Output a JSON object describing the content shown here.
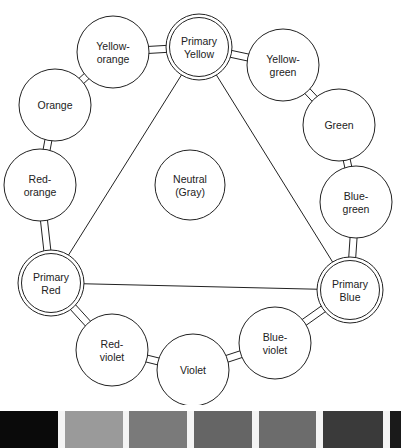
{
  "diagram": {
    "type": "color-wheel",
    "center": {
      "label_line1": "Neutral",
      "label_line2": "(Gray)",
      "cx": 190,
      "cy": 185,
      "r": 35
    },
    "nodes": [
      {
        "id": "primary-yellow",
        "line1": "Primary",
        "line2": "Yellow",
        "cx": 199,
        "cy": 47,
        "r": 33,
        "primary": true
      },
      {
        "id": "yellow-green",
        "line1": "Yellow-",
        "line2": "green",
        "cx": 283,
        "cy": 65,
        "r": 36,
        "primary": false
      },
      {
        "id": "green",
        "line1": "Green",
        "line2": "",
        "cx": 339,
        "cy": 125,
        "r": 36,
        "primary": false
      },
      {
        "id": "blue-green",
        "line1": "Blue-",
        "line2": "green",
        "cx": 356,
        "cy": 202,
        "r": 36,
        "primary": false
      },
      {
        "id": "primary-blue",
        "line1": "Primary",
        "line2": "Blue",
        "cx": 350,
        "cy": 290,
        "r": 33,
        "primary": true
      },
      {
        "id": "blue-violet",
        "line1": "Blue-",
        "line2": "violet",
        "cx": 275,
        "cy": 343,
        "r": 36,
        "primary": false
      },
      {
        "id": "violet",
        "line1": "Violet",
        "line2": "",
        "cx": 193,
        "cy": 370,
        "r": 36,
        "primary": false
      },
      {
        "id": "red-violet",
        "line1": "Red-",
        "line2": "violet",
        "cx": 112,
        "cy": 350,
        "r": 36,
        "primary": false
      },
      {
        "id": "primary-red",
        "line1": "Primary",
        "line2": "Red",
        "cx": 51,
        "cy": 283,
        "r": 33,
        "primary": true
      },
      {
        "id": "red-orange",
        "line1": "Red-",
        "line2": "orange",
        "cx": 40,
        "cy": 185,
        "r": 36,
        "primary": false
      },
      {
        "id": "orange",
        "line1": "Orange",
        "line2": "",
        "cx": 55,
        "cy": 105,
        "r": 36,
        "primary": false
      },
      {
        "id": "yellow-orange",
        "line1": "Yellow-",
        "line2": "orange",
        "cx": 113,
        "cy": 52,
        "r": 36,
        "primary": false
      }
    ],
    "triangle": [
      "primary-yellow",
      "primary-blue",
      "primary-red"
    ]
  },
  "swatches": [
    {
      "x": 0,
      "w": 58,
      "color": "#0a0a0a"
    },
    {
      "x": 65,
      "w": 58,
      "color": "#9a9a9a"
    },
    {
      "x": 129,
      "w": 58,
      "color": "#7a7a7a"
    },
    {
      "x": 194,
      "w": 58,
      "color": "#656565"
    },
    {
      "x": 259,
      "w": 57,
      "color": "#6c6c6c"
    },
    {
      "x": 323,
      "w": 60,
      "color": "#3a3a3a"
    },
    {
      "x": 390,
      "w": 11,
      "color": "#1a1a1a"
    }
  ],
  "colors": {
    "stroke": "#222222",
    "background": "#ffffff",
    "gap": "#f4f4f4"
  }
}
